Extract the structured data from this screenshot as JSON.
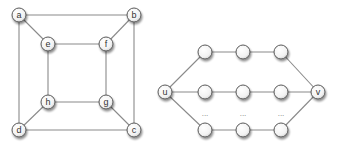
{
  "diagrams": [
    {
      "name": "cube-graph",
      "node_radius": 7,
      "nodes": [
        {
          "id": "a",
          "label": "a",
          "x": 19,
          "y": 15
        },
        {
          "id": "b",
          "label": "b",
          "x": 134,
          "y": 15
        },
        {
          "id": "c",
          "label": "c",
          "x": 134,
          "y": 130
        },
        {
          "id": "d",
          "label": "d",
          "x": 19,
          "y": 130
        },
        {
          "id": "e",
          "label": "e",
          "x": 48,
          "y": 44
        },
        {
          "id": "f",
          "label": "f",
          "x": 106,
          "y": 44
        },
        {
          "id": "g",
          "label": "g",
          "x": 106,
          "y": 102
        },
        {
          "id": "h",
          "label": "h",
          "x": 48,
          "y": 102
        }
      ],
      "edges": [
        [
          "a",
          "b"
        ],
        [
          "b",
          "c"
        ],
        [
          "c",
          "d"
        ],
        [
          "d",
          "a"
        ],
        [
          "e",
          "f"
        ],
        [
          "f",
          "g"
        ],
        [
          "g",
          "h"
        ],
        [
          "h",
          "e"
        ],
        [
          "a",
          "e"
        ],
        [
          "b",
          "f"
        ],
        [
          "c",
          "g"
        ],
        [
          "d",
          "h"
        ]
      ]
    },
    {
      "name": "parallel-paths-graph",
      "node_radius": 7,
      "nodes": [
        {
          "id": "u",
          "label": "u",
          "x": 165,
          "y": 92
        },
        {
          "id": "v",
          "label": "v",
          "x": 318,
          "y": 92
        },
        {
          "id": "p1a",
          "label": "",
          "x": 205,
          "y": 52
        },
        {
          "id": "p1b",
          "label": "",
          "x": 243,
          "y": 52
        },
        {
          "id": "p1c",
          "label": "",
          "x": 281,
          "y": 52
        },
        {
          "id": "p2a",
          "label": "",
          "x": 205,
          "y": 92
        },
        {
          "id": "p2b",
          "label": "",
          "x": 243,
          "y": 92
        },
        {
          "id": "p2c",
          "label": "",
          "x": 281,
          "y": 92
        },
        {
          "id": "p3a",
          "label": "",
          "x": 205,
          "y": 130
        },
        {
          "id": "p3b",
          "label": "",
          "x": 243,
          "y": 130
        },
        {
          "id": "p3c",
          "label": "",
          "x": 281,
          "y": 130
        }
      ],
      "edges": [
        [
          "u",
          "p1a"
        ],
        [
          "p1a",
          "p1b"
        ],
        [
          "p1b",
          "p1c"
        ],
        [
          "p1c",
          "v"
        ],
        [
          "u",
          "p2a"
        ],
        [
          "p2a",
          "p2b"
        ],
        [
          "p2b",
          "p2c"
        ],
        [
          "p2c",
          "v"
        ],
        [
          "u",
          "p3a"
        ],
        [
          "p3a",
          "p3b"
        ],
        [
          "p3b",
          "p3c"
        ],
        [
          "p3c",
          "v"
        ]
      ],
      "ellipses": [
        {
          "text": "...",
          "x": 205,
          "y": 116
        },
        {
          "text": "...",
          "x": 243,
          "y": 116
        },
        {
          "text": "...",
          "x": 281,
          "y": 116
        }
      ]
    }
  ]
}
